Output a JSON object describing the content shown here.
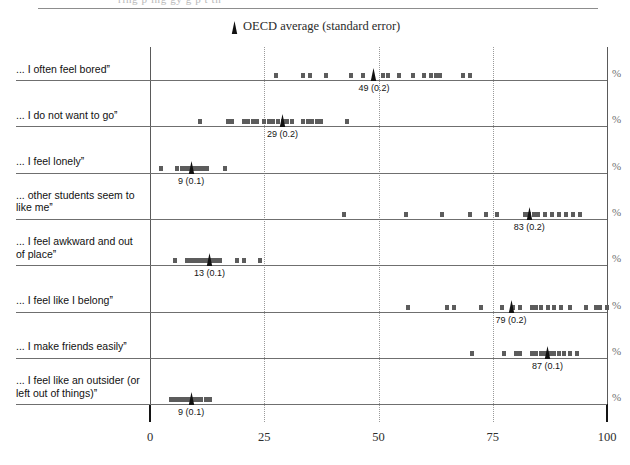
{
  "top_cropped_text": "ring   p  ing   gy   g   p         t     th",
  "legend": {
    "label": "OECD average (standard error)",
    "marker_icon": "triangle-marker-icon"
  },
  "axis": {
    "ticks": [
      0,
      25,
      50,
      75,
      100
    ],
    "unit_label": "%",
    "xmin": 0,
    "xmax": 100
  },
  "chart_data": {
    "type": "scatter",
    "title": "",
    "subtitle": "",
    "xlabel": "",
    "ylabel": "",
    "xlim": [
      0,
      100
    ],
    "grid": true,
    "legend_position": "top-center",
    "legend_entries": [
      "OECD average (standard error)"
    ],
    "unit": "%",
    "rows": [
      {
        "label": "... I often feel boredˮ",
        "average": 49,
        "standard_error": 0.2,
        "average_label": "49 (0.2)",
        "values": [
          27.5,
          33.5,
          35,
          38.5,
          44,
          46.5,
          51,
          52,
          54.5,
          57.5,
          60,
          61.5,
          62.5,
          63.5,
          68.5,
          70
        ]
      },
      {
        "label": "... I do not want to goˮ",
        "average": 29,
        "standard_error": 0.2,
        "average_label": "29 (0.2)",
        "values": [
          11,
          17,
          18,
          20.5,
          21.5,
          22.5,
          23.5,
          25,
          26,
          27,
          28,
          29,
          30,
          31,
          33.5,
          34.5,
          35.5,
          36.5,
          37.5,
          43
        ]
      },
      {
        "label": "... I feel lonelyˮ",
        "average": 9,
        "standard_error": 0.1,
        "average_label": "9 (0.1)",
        "values": [
          2.5,
          6,
          7,
          7.8,
          8.5,
          9.2,
          10,
          10.8,
          11.5,
          12.5,
          16.5
        ]
      },
      {
        "label": "... other students seem to like meˮ",
        "average": 83,
        "standard_error": 0.2,
        "average_label": "83 (0.2)",
        "values": [
          42.5,
          56,
          64,
          70,
          73.5,
          76,
          82,
          83,
          84,
          85,
          86.5,
          88,
          89.5,
          91,
          92.5,
          94
        ]
      },
      {
        "label": "... I feel awkward and out of placeˮ",
        "average": 13,
        "standard_error": 0.1,
        "average_label": "13 (0.1)",
        "values": [
          5.5,
          8,
          8.8,
          9.6,
          10.4,
          11.2,
          12,
          12.8,
          13.6,
          14.4,
          15.4,
          19,
          20.5,
          24
        ]
      },
      {
        "label": "... I feel like I belongˮ",
        "average": 79,
        "standard_error": 0.2,
        "average_label": "79 (0.2)",
        "values": [
          56.5,
          65,
          66.5,
          72.5,
          77,
          79.5,
          81,
          83.5,
          84.5,
          85.5,
          87,
          88.5,
          90,
          92,
          95.5,
          97.5,
          98.5,
          100
        ]
      },
      {
        "label": "... I make friends easilyˮ",
        "average": 87,
        "standard_error": 0.1,
        "average_label": "87 (0.1)",
        "values": [
          70.5,
          77.5,
          80,
          81,
          83.5,
          84.5,
          85.5,
          86.5,
          87.5,
          88.5,
          89.5,
          90.5,
          92,
          93.5
        ]
      },
      {
        "label": "... I feel like an outsider (or left out of things)ˮ",
        "average": 9,
        "standard_error": 0.1,
        "average_label": "9 (0.1)",
        "values": [
          4.5,
          5.3,
          6.1,
          6.9,
          7.7,
          8.5,
          9.3,
          10.2,
          11.2,
          12.3,
          13.2
        ]
      }
    ]
  }
}
